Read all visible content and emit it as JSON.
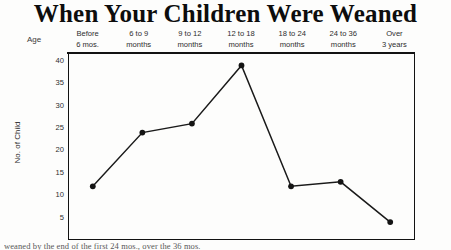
{
  "title": "When Your Children Were Weaned",
  "axis": {
    "age_label": "Age",
    "y_title": "No. of Child"
  },
  "bottom_caption": "weaned by the end of the first 24 mos., over the 36 mos.",
  "colors": {
    "ink": "#121212",
    "paper": "#fdfdfc",
    "line": "#1a1a1a"
  },
  "chart_data": {
    "type": "line",
    "title": "When Your Children Were Weaned",
    "xlabel": "Age",
    "ylabel": "No. of Child",
    "ylim": [
      0,
      42
    ],
    "yticks": [
      40,
      35,
      30,
      25,
      20,
      15,
      10,
      5
    ],
    "grid": false,
    "legend": "none",
    "categories": [
      "Before 6 mos.",
      "6 to 9 months",
      "9 to 12 months",
      "12 to 18 months",
      "18 to 24 months",
      "24 to 36 months",
      "Over 3 years"
    ],
    "category_lines": [
      [
        "Before",
        "6 mos."
      ],
      [
        "6 to 9",
        "months"
      ],
      [
        "9 to 12",
        "months"
      ],
      [
        "12 to 18",
        "months"
      ],
      [
        "18 to 24",
        "months"
      ],
      [
        "24 to 36",
        "months"
      ],
      [
        "Over",
        "3 years"
      ]
    ],
    "values": [
      12,
      24,
      26,
      39,
      12,
      13,
      4
    ],
    "markers": "filled-circle"
  }
}
